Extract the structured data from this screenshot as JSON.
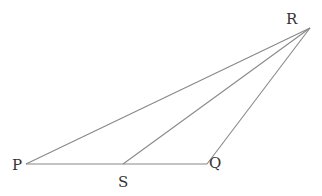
{
  "diagram": {
    "type": "triangle",
    "points": {
      "P": {
        "x": 26,
        "y": 164
      },
      "S": {
        "x": 123,
        "y": 164
      },
      "Q": {
        "x": 207,
        "y": 164
      },
      "R": {
        "x": 310,
        "y": 28
      }
    },
    "segments": [
      [
        "P",
        "Q"
      ],
      [
        "P",
        "R"
      ],
      [
        "Q",
        "R"
      ],
      [
        "S",
        "R"
      ]
    ],
    "labels": {
      "P": "P",
      "Q": "Q",
      "R": "R",
      "S": "S"
    },
    "line_color": "#888888",
    "label_color": "#333333"
  }
}
